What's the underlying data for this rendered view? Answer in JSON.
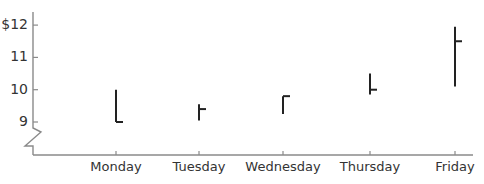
{
  "chart_data": {
    "type": "ohlc",
    "title": "",
    "xlabel": "",
    "ylabel": "",
    "categories": [
      "Monday",
      "Tuesday",
      "Wednesday",
      "Thursday",
      "Friday"
    ],
    "series": [
      {
        "name": "High",
        "values": [
          10.0,
          9.55,
          9.8,
          10.5,
          11.95
        ]
      },
      {
        "name": "Low",
        "values": [
          9.0,
          9.05,
          9.25,
          9.85,
          10.1
        ]
      },
      {
        "name": "Close",
        "values": [
          9.0,
          9.4,
          9.8,
          10.0,
          11.5
        ]
      }
    ],
    "yticks": [
      9,
      10,
      11,
      12
    ],
    "ytick_labels": [
      "9",
      "10",
      "11",
      "$12"
    ],
    "ylim": [
      8.3,
      12.4
    ],
    "axis_break": true,
    "grid": false,
    "legend": "none"
  },
  "colors": {
    "axis": "#8a8a8a",
    "bars": "#222222",
    "text": "#333333"
  }
}
